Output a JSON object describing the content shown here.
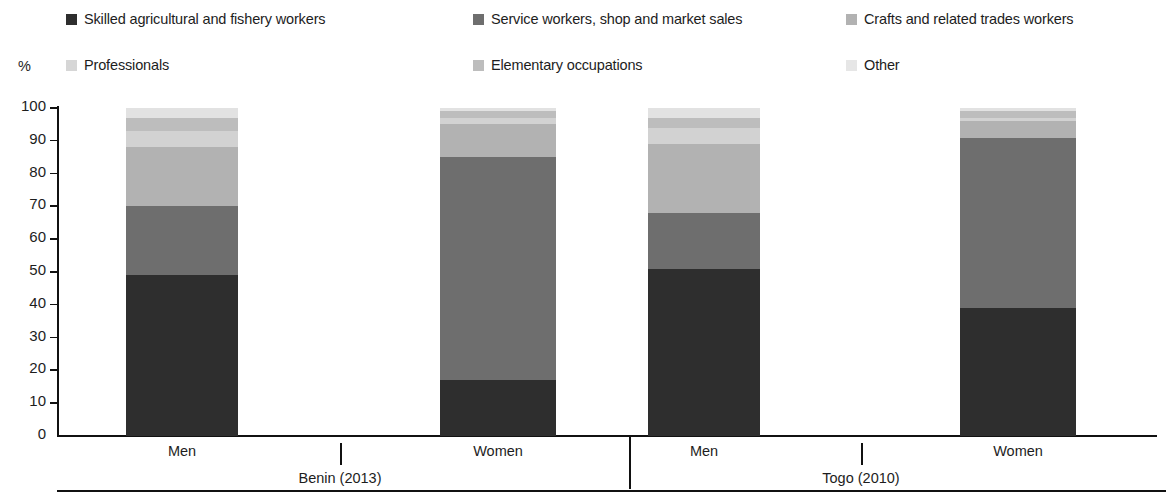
{
  "axis": {
    "unit_label": "%",
    "y_ticks": [
      100,
      90,
      80,
      70,
      60,
      50,
      40,
      30,
      20,
      10,
      0
    ]
  },
  "legend": {
    "items": [
      {
        "label": "Skilled agricultural and fishery workers",
        "color": "#2e2e2e"
      },
      {
        "label": "Service workers, shop and market sales",
        "color": "#6e6e6e"
      },
      {
        "label": "Crafts and related trades workers",
        "color": "#b2b2b2"
      },
      {
        "label": "Professionals",
        "color": "#d2d2d2"
      },
      {
        "label": "Elementary occupations",
        "color": "#bdbdbd"
      },
      {
        "label": "Other",
        "color": "#e2e2e2"
      }
    ]
  },
  "groups": [
    {
      "name": "Benin (2013)",
      "categories": [
        "Men",
        "Women"
      ]
    },
    {
      "name": "Togo (2010)",
      "categories": [
        "Men",
        "Women"
      ]
    }
  ],
  "chart_data": {
    "type": "bar",
    "subtype": "stacked-vertical-100",
    "title": "",
    "xlabel": "",
    "ylabel": "%",
    "ylim": [
      0,
      100
    ],
    "ytick_step": 10,
    "grid": false,
    "legend_position": "top",
    "categories": [
      "Men",
      "Women",
      "Men",
      "Women"
    ],
    "group_labels": [
      "Benin (2013)",
      "Benin (2013)",
      "Togo (2010)",
      "Togo (2010)"
    ],
    "series": [
      {
        "name": "Skilled agricultural and fishery workers",
        "color": "#2e2e2e",
        "values": [
          49,
          17,
          51,
          39
        ]
      },
      {
        "name": "Service workers, shop and market sales",
        "color": "#6e6e6e",
        "values": [
          21,
          68,
          17,
          52
        ]
      },
      {
        "name": "Crafts and related trades workers",
        "color": "#b2b2b2",
        "values": [
          18,
          10,
          21,
          5
        ]
      },
      {
        "name": "Professionals",
        "color": "#d2d2d2",
        "values": [
          5,
          2,
          5,
          1
        ]
      },
      {
        "name": "Elementary occupations",
        "color": "#bdbdbd",
        "values": [
          4,
          2,
          3,
          2
        ]
      },
      {
        "name": "Other",
        "color": "#e2e2e2",
        "values": [
          3,
          1,
          3,
          1
        ]
      }
    ]
  }
}
